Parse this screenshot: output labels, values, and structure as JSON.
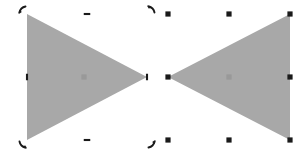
{
  "canvas": {
    "width": 302,
    "height": 159,
    "background_color": "#FFFFFF",
    "shape_fill_color": "#A8A8A8",
    "handle_color": "#1A1A1A",
    "pivot_color": "#8C8C8C"
  },
  "objects": [
    {
      "id": "left-triangle",
      "label": "Triangle pointing right",
      "fill": "#A8A8A8",
      "points": "27,14 27,140 147,77",
      "direction": "right",
      "selection": {
        "mode": "rotate",
        "handle_style": "curved-arc",
        "bbox": {
          "x": 27,
          "y": 14,
          "width": 120,
          "height": 126
        },
        "pivot": {
          "x": 84,
          "y": 77
        },
        "handles": [
          {
            "name": "rotate-handle-top-left",
            "x": 27,
            "y": 14,
            "kind": "corner",
            "rotation": 0
          },
          {
            "name": "rotate-handle-top-right",
            "x": 147,
            "y": 14,
            "kind": "corner",
            "rotation": 90
          },
          {
            "name": "rotate-handle-bottom-right",
            "x": 147,
            "y": 140,
            "kind": "corner",
            "rotation": 180
          },
          {
            "name": "rotate-handle-bottom-left",
            "x": 27,
            "y": 140,
            "kind": "corner",
            "rotation": 270
          },
          {
            "name": "skew-handle-top-center",
            "x": 87,
            "y": 14,
            "kind": "edge",
            "orientation": "horizontal"
          },
          {
            "name": "skew-handle-middle-right",
            "x": 147,
            "y": 77,
            "kind": "edge",
            "orientation": "vertical"
          },
          {
            "name": "skew-handle-bottom-center",
            "x": 87,
            "y": 140,
            "kind": "edge",
            "orientation": "horizontal"
          },
          {
            "name": "skew-handle-middle-left",
            "x": 27,
            "y": 77,
            "kind": "edge",
            "orientation": "vertical"
          }
        ]
      }
    },
    {
      "id": "right-triangle",
      "label": "Triangle pointing left",
      "fill": "#A8A8A8",
      "points": "290,14 290,140 168,77",
      "direction": "left",
      "selection": {
        "mode": "scale",
        "handle_style": "square",
        "bbox": {
          "x": 168,
          "y": 14,
          "width": 122,
          "height": 126
        },
        "pivot": {
          "x": 229,
          "y": 77
        },
        "handles": [
          {
            "name": "resize-handle-top-left",
            "x": 168,
            "y": 14,
            "kind": "corner"
          },
          {
            "name": "resize-handle-top-center",
            "x": 229,
            "y": 14,
            "kind": "edge"
          },
          {
            "name": "resize-handle-top-right",
            "x": 290,
            "y": 14,
            "kind": "corner"
          },
          {
            "name": "resize-handle-middle-right",
            "x": 290,
            "y": 77,
            "kind": "edge"
          },
          {
            "name": "resize-handle-bottom-right",
            "x": 290,
            "y": 140,
            "kind": "corner"
          },
          {
            "name": "resize-handle-bottom-center",
            "x": 229,
            "y": 140,
            "kind": "edge"
          },
          {
            "name": "resize-handle-bottom-left",
            "x": 168,
            "y": 140,
            "kind": "corner"
          },
          {
            "name": "resize-handle-middle-left",
            "x": 168,
            "y": 77,
            "kind": "edge"
          }
        ]
      }
    }
  ]
}
